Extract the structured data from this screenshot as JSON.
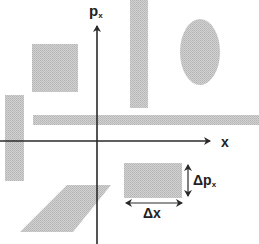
{
  "diagram": {
    "axes": {
      "horizontal": {
        "label": "x"
      },
      "vertical": {
        "label_main": "p",
        "label_sub": "x"
      }
    },
    "annotations": {
      "delta_p": {
        "main": "Δp",
        "sub": "x"
      },
      "delta_x": {
        "main": "Δx"
      }
    },
    "shapes": [
      {
        "kind": "square",
        "name": "upper-left-square"
      },
      {
        "kind": "tall-rectangle",
        "name": "upper-vertical-bar"
      },
      {
        "kind": "ellipse",
        "name": "upper-right-ellipse"
      },
      {
        "kind": "long-horizontal-rectangle",
        "name": "horizontal-strip"
      },
      {
        "kind": "vertical-rectangle",
        "name": "left-vertical-bar"
      },
      {
        "kind": "rectangle",
        "name": "reference-cell-dx-dp"
      },
      {
        "kind": "parallelogram",
        "name": "sheared-parallelogram"
      }
    ],
    "colors": {
      "fill": "#c8c8c8",
      "axis": "#2a2a2a",
      "background": "#ffffff"
    }
  }
}
